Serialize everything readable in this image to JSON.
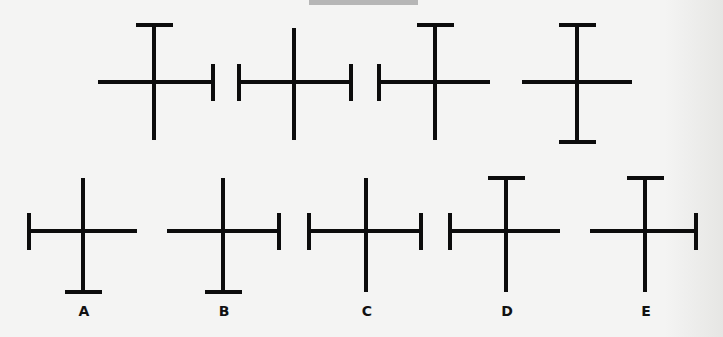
{
  "puzzle": {
    "ink_color": "#0c0c0c",
    "background_color": "#f4f4f3",
    "top_tab_color": "#b6b6b6",
    "sequence": [
      {
        "id": "seq-1",
        "cross": {
          "cx": 154,
          "cy": 82,
          "h_left": 98,
          "h_right": 213,
          "v_top": 25,
          "v_bottom": 140
        },
        "caps": [
          "top",
          "right"
        ]
      },
      {
        "id": "seq-2",
        "cross": {
          "cx": 294,
          "cy": 82,
          "h_left": 239,
          "h_right": 351,
          "v_top": 28,
          "v_bottom": 140
        },
        "caps": [
          "left",
          "right"
        ]
      },
      {
        "id": "seq-3",
        "cross": {
          "cx": 435,
          "cy": 82,
          "h_left": 379,
          "h_right": 490,
          "v_top": 25,
          "v_bottom": 140
        },
        "caps": [
          "left",
          "top"
        ]
      },
      {
        "id": "seq-4",
        "cross": {
          "cx": 577,
          "cy": 82,
          "h_left": 522,
          "h_right": 632,
          "v_top": 25,
          "v_bottom": 142
        },
        "caps": [
          "top",
          "bottom"
        ]
      }
    ],
    "options": [
      {
        "id": "A",
        "label": "A",
        "cross": {
          "cx": 83,
          "cy": 231,
          "h_left": 29,
          "h_right": 137,
          "v_top": 178,
          "v_bottom": 292
        },
        "caps": [
          "left",
          "bottom"
        ]
      },
      {
        "id": "B",
        "label": "B",
        "cross": {
          "cx": 223,
          "cy": 231,
          "h_left": 167,
          "h_right": 279,
          "v_top": 178,
          "v_bottom": 292
        },
        "caps": [
          "right",
          "bottom"
        ]
      },
      {
        "id": "C",
        "label": "C",
        "cross": {
          "cx": 366,
          "cy": 231,
          "h_left": 309,
          "h_right": 421,
          "v_top": 178,
          "v_bottom": 292
        },
        "caps": [
          "left",
          "right"
        ]
      },
      {
        "id": "D",
        "label": "D",
        "cross": {
          "cx": 506,
          "cy": 231,
          "h_left": 450,
          "h_right": 560,
          "v_top": 178,
          "v_bottom": 292
        },
        "caps": [
          "left",
          "top"
        ]
      },
      {
        "id": "E",
        "label": "E",
        "cross": {
          "cx": 645,
          "cy": 231,
          "h_left": 590,
          "h_right": 696,
          "v_top": 178,
          "v_bottom": 292
        },
        "caps": [
          "top",
          "right"
        ]
      }
    ]
  }
}
